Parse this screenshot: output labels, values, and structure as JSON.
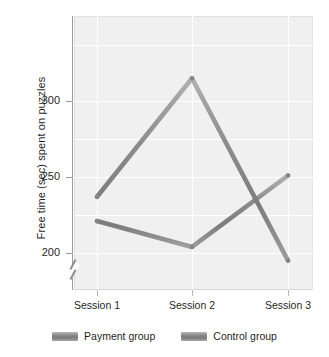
{
  "chart_data": {
    "type": "line",
    "title": "",
    "xlabel": "",
    "ylabel": "Free time (sec) spent on puzzles",
    "categories": [
      "Session 1",
      "Session 2",
      "Session 3"
    ],
    "series": [
      {
        "name": "Payment group",
        "values": [
          221,
          204,
          251
        ],
        "color": "#8a8a8a"
      },
      {
        "name": "Control group",
        "values": [
          237,
          315,
          195
        ],
        "color": "#8a8a8a"
      }
    ],
    "ylim": [
      180,
      330
    ],
    "yticks": [
      200,
      250,
      300
    ],
    "ytick_labels": [
      "200",
      "250",
      "300"
    ],
    "axis_break": true,
    "grid": true,
    "legend_position": "bottom"
  },
  "axis": {
    "y_title": "Free time (sec) spent on puzzles",
    "y_tick_200": "200",
    "y_tick_250": "250",
    "y_tick_300": "300",
    "x_tick_1": "Session 1",
    "x_tick_2": "Session 2",
    "x_tick_3": "Session 3"
  },
  "legend": {
    "items": [
      {
        "label": "Payment group"
      },
      {
        "label": "Control group"
      }
    ]
  },
  "colors": {
    "plot_background": "#f0f0f0",
    "gridline": "#ffffff",
    "series_line": "#8a8a8a",
    "axis": "#9a9a9a",
    "text": "#1f1f1f"
  }
}
